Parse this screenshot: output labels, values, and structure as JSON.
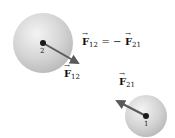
{
  "diagram": {
    "particles": [
      {
        "id": "2",
        "label": "2",
        "cx": 43,
        "cy": 43,
        "r": 30,
        "color": "#c8c8c8"
      },
      {
        "id": "1",
        "label": "1",
        "cx": 146,
        "cy": 116,
        "r": 21,
        "color": "#c8c8c8"
      }
    ],
    "forces": [
      {
        "name": "F12",
        "symbol": "F",
        "subscript": "12",
        "from": [
          43,
          43
        ],
        "to": [
          79,
          64
        ],
        "color": "#5a5a5a"
      },
      {
        "name": "F21",
        "symbol": "F",
        "subscript": "21",
        "from": [
          146,
          116
        ],
        "to": [
          116,
          100
        ],
        "color": "#5a5a5a"
      }
    ],
    "equation": {
      "lhs_symbol": "F",
      "lhs_sub": "12",
      "op": "= −",
      "rhs_symbol": "F",
      "rhs_sub": "21"
    }
  }
}
